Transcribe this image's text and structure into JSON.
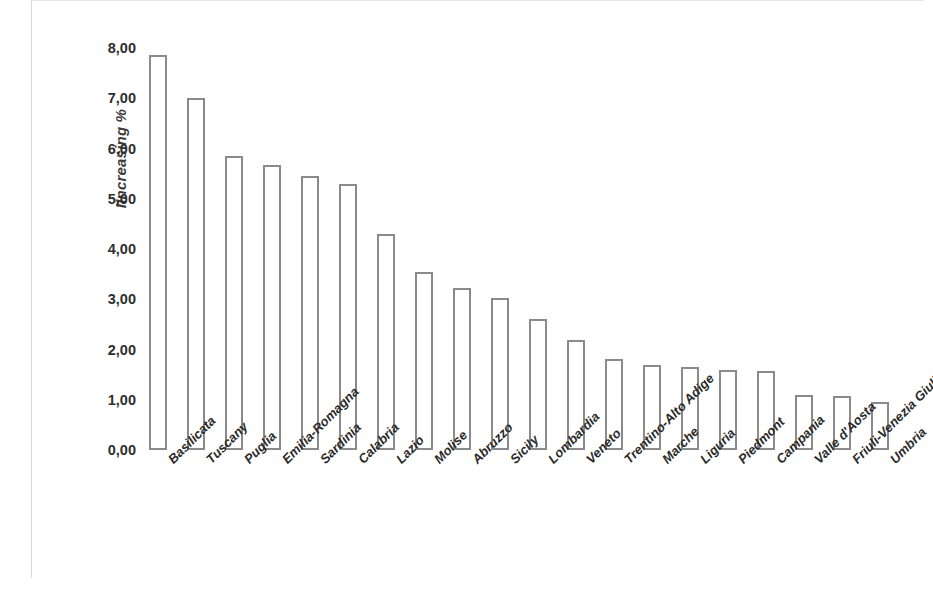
{
  "chart_data": {
    "type": "bar",
    "title": "",
    "subtitle": "",
    "xlabel": "",
    "ylabel": "IIncreasing %",
    "ylim": [
      0,
      8
    ],
    "ytick_labels": [
      "8,00",
      "7,00",
      "6,00",
      "5,00",
      "4,00",
      "3,00",
      "2,00",
      "1,00",
      "0,00"
    ],
    "ytick_values": [
      8,
      7,
      6,
      5,
      4,
      3,
      2,
      1,
      0
    ],
    "grid": false,
    "legend": null,
    "decimal_separator": ",",
    "categories": [
      "Basilicata",
      "Tuscany",
      "Puglia",
      "Emilia-Romagna",
      "Sardinia",
      "Calabria",
      "Lazio",
      "Molise",
      "Abruzzo",
      "Sicily",
      "Lombardia",
      "Veneto",
      "Trentino-Alto Adige",
      "Marche",
      "Liguria",
      "Piedmont",
      "Campania",
      "Valle d'Aosta",
      "Friuli-Venezia Giulia",
      "Umbria"
    ],
    "values": [
      7.86,
      7.0,
      5.85,
      5.67,
      5.45,
      5.3,
      4.3,
      3.54,
      3.22,
      3.02,
      2.6,
      2.18,
      1.82,
      1.7,
      1.66,
      1.6,
      1.58,
      1.1,
      1.07,
      0.95
    ],
    "bar_style": {
      "fill": "#ffffff",
      "edge": "#8a8a8a"
    }
  }
}
